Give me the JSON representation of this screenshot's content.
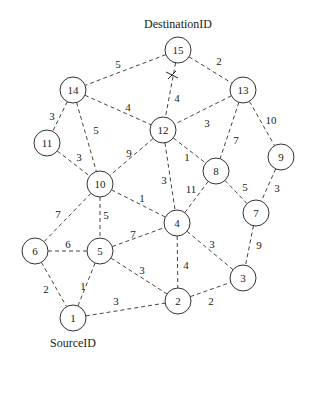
{
  "labels": {
    "destination": "DestinationID",
    "source": "SourceID"
  },
  "nodes": [
    {
      "id": "1",
      "x": 73,
      "y": 318
    },
    {
      "id": "2",
      "x": 178,
      "y": 301
    },
    {
      "id": "3",
      "x": 243,
      "y": 278
    },
    {
      "id": "4",
      "x": 177,
      "y": 223
    },
    {
      "id": "5",
      "x": 100,
      "y": 251
    },
    {
      "id": "6",
      "x": 35,
      "y": 251
    },
    {
      "id": "7",
      "x": 256,
      "y": 213
    },
    {
      "id": "8",
      "x": 216,
      "y": 171
    },
    {
      "id": "9",
      "x": 281,
      "y": 157
    },
    {
      "id": "10",
      "x": 100,
      "y": 184
    },
    {
      "id": "11",
      "x": 47,
      "y": 143
    },
    {
      "id": "12",
      "x": 163,
      "y": 130
    },
    {
      "id": "13",
      "x": 243,
      "y": 90
    },
    {
      "id": "14",
      "x": 73,
      "y": 90
    },
    {
      "id": "15",
      "x": 178,
      "y": 50
    }
  ],
  "edges": [
    {
      "from": "15",
      "to": "14",
      "weight": "5",
      "lx": 118,
      "ly": 64
    },
    {
      "from": "15",
      "to": "13",
      "weight": "2",
      "lx": 219,
      "ly": 61
    },
    {
      "from": "15",
      "to": "12",
      "weight": "4",
      "lx": 177,
      "ly": 98
    },
    {
      "from": "14",
      "to": "12",
      "weight": "4",
      "lx": 128,
      "ly": 107
    },
    {
      "from": "14",
      "to": "11",
      "weight": "3",
      "lx": 52,
      "ly": 116
    },
    {
      "from": "14",
      "to": "10",
      "weight": "5",
      "lx": 96,
      "ly": 130
    },
    {
      "from": "13",
      "to": "12",
      "weight": "3",
      "lx": 207,
      "ly": 123
    },
    {
      "from": "13",
      "to": "8",
      "weight": "7",
      "lx": 236,
      "ly": 140
    },
    {
      "from": "13",
      "to": "9",
      "weight": "10",
      "lx": 271,
      "ly": 120
    },
    {
      "from": "12",
      "to": "10",
      "weight": "9",
      "lx": 129,
      "ly": 153
    },
    {
      "from": "12",
      "to": "8",
      "weight": "1",
      "lx": 187,
      "ly": 157
    },
    {
      "from": "12",
      "to": "4",
      "weight": "3",
      "lx": 164,
      "ly": 180
    },
    {
      "from": "11",
      "to": "10",
      "weight": "3",
      "lx": 79,
      "ly": 157
    },
    {
      "from": "8",
      "to": "4",
      "weight": "11",
      "lx": 191,
      "ly": 189
    },
    {
      "from": "8",
      "to": "7",
      "weight": "5",
      "lx": 245,
      "ly": 187
    },
    {
      "from": "9",
      "to": "7",
      "weight": "3",
      "lx": 277,
      "ly": 188
    },
    {
      "from": "10",
      "to": "4",
      "weight": "1",
      "lx": 142,
      "ly": 198
    },
    {
      "from": "10",
      "to": "6",
      "weight": "7",
      "lx": 58,
      "ly": 214
    },
    {
      "from": "10",
      "to": "5",
      "weight": "5",
      "lx": 106,
      "ly": 215
    },
    {
      "from": "6",
      "to": "5",
      "weight": "6",
      "lx": 68,
      "ly": 244
    },
    {
      "from": "5",
      "to": "4",
      "weight": "7",
      "lx": 133,
      "ly": 234
    },
    {
      "from": "4",
      "to": "3",
      "weight": "3",
      "lx": 212,
      "ly": 244
    },
    {
      "from": "4",
      "to": "2",
      "weight": "4",
      "lx": 186,
      "ly": 265
    },
    {
      "from": "7",
      "to": "3",
      "weight": "9",
      "lx": 259,
      "ly": 245
    },
    {
      "from": "6",
      "to": "1",
      "weight": "2",
      "lx": 46,
      "ly": 289
    },
    {
      "from": "5",
      "to": "1",
      "weight": "1",
      "lx": 83,
      "ly": 286
    },
    {
      "from": "5",
      "to": "2",
      "weight": "3",
      "lx": 142,
      "ly": 270
    },
    {
      "from": "1",
      "to": "2",
      "weight": "3",
      "lx": 116,
      "ly": 301
    },
    {
      "from": "2",
      "to": "3",
      "weight": "2",
      "lx": 211,
      "ly": 301
    }
  ],
  "blocked_edge_marker": {
    "x": 172,
    "y": 75,
    "icon": "x-mark-icon"
  },
  "node_radius": 13
}
